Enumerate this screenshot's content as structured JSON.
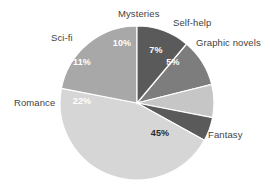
{
  "chart_data": {
    "type": "pie",
    "title": "",
    "subtitle": "",
    "xlabel": "",
    "ylabel": "",
    "legend_position": "outside-labels",
    "grid": false,
    "units": "percent",
    "categories": [
      "Mysteries",
      "Self-help",
      "Graphic novels",
      "Fantasy",
      "Romance",
      "Sci-fi"
    ],
    "values": [
      10,
      7,
      5,
      45,
      22,
      11
    ],
    "value_labels": [
      "10%",
      "7%",
      "5%",
      "45%",
      "22%",
      "11%"
    ],
    "slices": [
      {
        "label": "Mysteries",
        "value": 10,
        "value_label": "10%",
        "color": "#7d7d7d",
        "label_color": "#ffffff",
        "start_angle": -50,
        "end_angle": -14,
        "label_x": 118,
        "label_y": 9,
        "value_x": 122,
        "value_y": 44
      },
      {
        "label": "Self-help",
        "value": 7,
        "value_label": "7%",
        "color": "#c6c6c6",
        "label_color": "#ffffff",
        "start_angle": -14,
        "end_angle": 11,
        "label_x": 173,
        "label_y": 18,
        "value_x": 156,
        "value_y": 51
      },
      {
        "label": "Graphic novels",
        "value": 5,
        "value_label": "5%",
        "color": "#5a5a5a",
        "label_color": "#ffffff",
        "start_angle": 11,
        "end_angle": 29,
        "label_x": 196,
        "label_y": 38,
        "value_x": 173,
        "value_y": 63
      },
      {
        "label": "Fantasy",
        "value": 45,
        "value_label": "45%",
        "color": "#d6d6d6",
        "label_color": "#2b2b2b",
        "start_angle": 29,
        "end_angle": 191,
        "label_x": 208,
        "label_y": 130,
        "value_x": 160,
        "value_y": 134
      },
      {
        "label": "Romance",
        "value": 22,
        "value_label": "22%",
        "color": "#a8a8a8",
        "label_color": "#ffffff",
        "start_angle": 191,
        "end_angle": 270,
        "label_x": 14,
        "label_y": 98,
        "value_x": 82,
        "value_y": 102
      },
      {
        "label": "Sci-fi",
        "value": 11,
        "value_label": "11%",
        "color": "#5a5a5a",
        "label_color": "#ffffff",
        "start_angle": 270,
        "end_angle": 310,
        "label_x": 51,
        "label_y": 33,
        "value_x": 82,
        "value_y": 63
      }
    ],
    "geometry": {
      "center_x": 137,
      "center_y": 103,
      "radius": 77
    }
  }
}
